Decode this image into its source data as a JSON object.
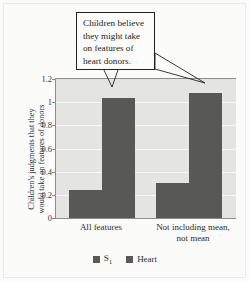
{
  "chart_data": {
    "type": "bar",
    "title": "",
    "xlabel": "",
    "ylabel_line1": "Children's judgments that they",
    "ylabel_line2": "would take on features of donors",
    "categories": [
      "All features",
      "Not including mean, not mean"
    ],
    "category_lines": [
      [
        "All features"
      ],
      [
        "Not including mean,",
        "not mean"
      ]
    ],
    "series": [
      {
        "name": "S1",
        "values": [
          0.24,
          0.3
        ]
      },
      {
        "name": "Heart",
        "values": [
          1.04,
          1.08
        ]
      }
    ],
    "ylim": [
      0,
      1.2
    ],
    "yticks": [
      "1.2",
      "1",
      "0.8",
      "0.6",
      "0.4",
      "0.2",
      "0"
    ],
    "ytick_values": [
      1.2,
      1.0,
      0.8,
      0.6,
      0.4,
      0.2,
      0
    ],
    "grid": true,
    "legend_position": "bottom",
    "legend": [
      {
        "label_main": "S",
        "label_sub": "1",
        "color": "#585856"
      },
      {
        "label_main": "Heart",
        "label_sub": "",
        "color": "#585856"
      }
    ],
    "annotations": [
      {
        "text": "Children believe they might take on features of heart donors.",
        "lines": [
          "Children believe",
          "they might take",
          "on features of",
          "heart donors."
        ],
        "points_to": [
          "All features / Heart",
          "Not including mean, not mean / Heart"
        ]
      }
    ],
    "colors": {
      "bar": "#585856",
      "plot_background": "#e4e4e2",
      "gridline": "#f6f6f5",
      "axis": "#8d8d8a",
      "figure_background": "#fbfbfa",
      "text": "#2e2e2c",
      "callout_border": "#23231f",
      "callout_background": "#fcfcfb"
    }
  }
}
